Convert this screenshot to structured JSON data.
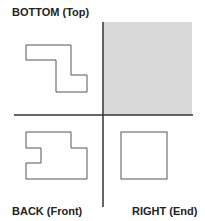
{
  "labels": {
    "top_left": "BOTTOM (Top)",
    "bottom_left": "BACK (Front)",
    "bottom_right": "RIGHT (End)"
  },
  "colors": {
    "shaded_quadrant": "#d9d9d9",
    "divider": "#333333",
    "outline": "#555555"
  },
  "views": [
    {
      "name": "bottom-top-view",
      "shape": "z-step"
    },
    {
      "name": "back-front-view",
      "shape": "notched-rectangle"
    },
    {
      "name": "right-end-view",
      "shape": "square"
    },
    {
      "name": "empty-quadrant",
      "shape": "shaded"
    }
  ]
}
